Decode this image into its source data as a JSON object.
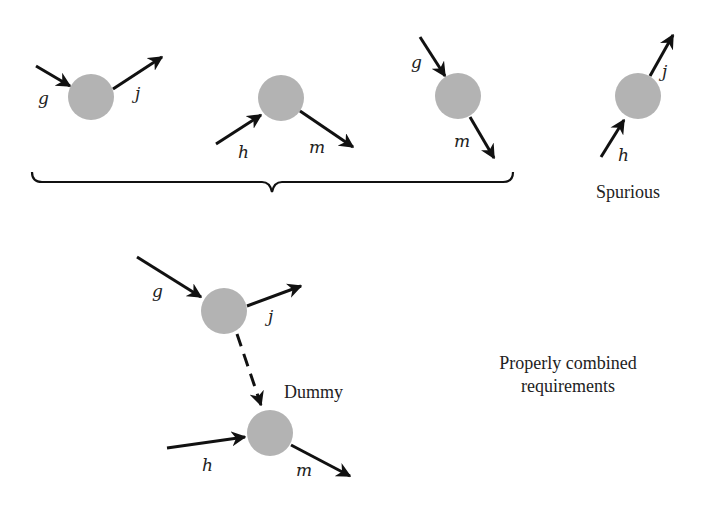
{
  "colors": {
    "node": "#b3b3b3",
    "line": "#111111",
    "text": "#222222"
  },
  "top_row": {
    "diagrams": [
      {
        "name": "g-to-j",
        "node": {
          "cx": 91,
          "cy": 65
        },
        "labels": {
          "in": "g",
          "out": "j"
        }
      },
      {
        "name": "h-to-m",
        "node": {
          "cx": 281,
          "cy": 98
        },
        "labels": {
          "in": "h",
          "out": "m"
        }
      },
      {
        "name": "g-to-m",
        "node": {
          "cx": 458,
          "cy": 96
        },
        "labels": {
          "in": "g",
          "out": "m"
        }
      },
      {
        "name": "h-to-j",
        "node": {
          "cx": 638,
          "cy": 96
        },
        "labels": {
          "in": "h",
          "out": "j"
        }
      }
    ],
    "spurious_label": "Spurious"
  },
  "combined": {
    "upper_node": {
      "labels": {
        "in": "g",
        "out": "j"
      }
    },
    "lower_node": {
      "labels": {
        "in": "h",
        "out": "m"
      }
    },
    "dummy_label": "Dummy",
    "caption_line1": "Properly combined",
    "caption_line2": "requirements"
  }
}
